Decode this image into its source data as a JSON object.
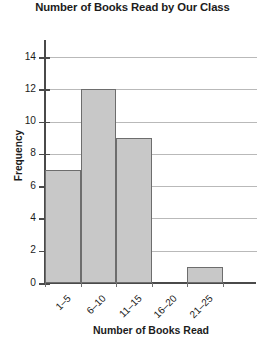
{
  "chart_data": {
    "type": "bar",
    "title": "Number of Books Read by Our Class",
    "xlabel": "Number of Books Read",
    "ylabel": "Frequency",
    "categories": [
      "1–5",
      "6–10",
      "11–15",
      "16–20",
      "21–25"
    ],
    "values": [
      7,
      12,
      9,
      0,
      1
    ],
    "ylim": [
      0,
      15
    ],
    "ytick_labels": [
      "0",
      "2",
      "4",
      "6",
      "8",
      "10",
      "12",
      "14"
    ],
    "ytick_values": [
      0,
      2,
      4,
      6,
      8,
      10,
      12,
      14
    ],
    "grid": "horizontal",
    "legend": "none",
    "bar_fill_color": "#c8c8c8",
    "bar_border_color": "#6d6d6d",
    "gridline_color": "#b9b9b9",
    "axis_color": "#4a4a4a",
    "text_color": "#1c1c1c",
    "background_color": "#ffffff"
  }
}
